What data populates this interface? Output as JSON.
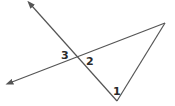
{
  "diagram": {
    "type": "geometry-angles",
    "stroke_color": "#555555",
    "label_color": "#2a2a2a",
    "lines": [
      {
        "name": "line-a",
        "from": [
          32,
          6
        ],
        "to": [
          117,
          101
        ],
        "arrow_at_start": true
      },
      {
        "name": "line-b",
        "from": [
          12,
          82
        ],
        "to": [
          165,
          23
        ],
        "arrow_at_start": true
      },
      {
        "name": "segment-c",
        "from": [
          165,
          23
        ],
        "to": [
          117,
          101
        ],
        "arrow_at_start": false
      }
    ],
    "intersection": [
      77,
      58
    ],
    "vertices": {
      "top_right": [
        165,
        23
      ],
      "bottom": [
        117,
        101
      ]
    },
    "labels": [
      {
        "id": "angle-1",
        "text": "1",
        "x": 113,
        "y": 86
      },
      {
        "id": "angle-2",
        "text": "2",
        "x": 86,
        "y": 56
      },
      {
        "id": "angle-3",
        "text": "3",
        "x": 61,
        "y": 50
      }
    ]
  }
}
